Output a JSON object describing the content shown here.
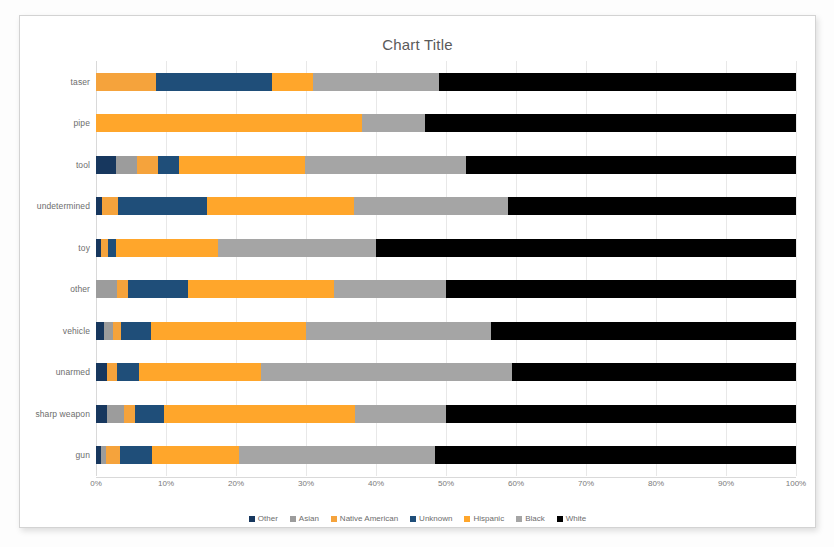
{
  "chart_data": {
    "type": "bar",
    "subtype": "stacked-horizontal-100percent",
    "title": "Chart Title",
    "xlabel": "",
    "ylabel": "",
    "xlim": [
      0,
      100
    ],
    "xticks": [
      "0%",
      "10%",
      "20%",
      "30%",
      "40%",
      "50%",
      "60%",
      "70%",
      "80%",
      "90%",
      "100%"
    ],
    "grid": true,
    "legend_position": "bottom",
    "categories": [
      "taser",
      "pipe",
      "tool",
      "undetermined",
      "toy",
      "other",
      "vehicle",
      "unarmed",
      "sharp weapon",
      "gun"
    ],
    "series": [
      {
        "name": "Other",
        "color": "#17375E",
        "values": [
          0.0,
          0.0,
          2.9,
          0.8,
          0.7,
          0.0,
          1.2,
          1.6,
          1.5,
          0.7
        ]
      },
      {
        "name": "Asian",
        "color": "#9C9C9C",
        "values": [
          0.0,
          0.0,
          3.0,
          0.0,
          0.0,
          3.0,
          1.2,
          0.0,
          2.5,
          0.8
        ]
      },
      {
        "name": "Native American",
        "color": "#F5A33C",
        "values": [
          8.6,
          0.0,
          3.0,
          2.3,
          1.0,
          1.6,
          1.2,
          1.4,
          1.5,
          2.0
        ]
      },
      {
        "name": "Unknown",
        "color": "#1F4E79",
        "values": [
          16.5,
          0.0,
          3.0,
          12.8,
          1.2,
          8.5,
          4.2,
          3.2,
          4.2,
          4.5
        ]
      },
      {
        "name": "Hispanic",
        "color": "#FFA62B",
        "values": [
          5.9,
          38.0,
          18.0,
          21.0,
          14.6,
          20.9,
          22.2,
          17.4,
          27.3,
          12.5
        ]
      },
      {
        "name": "Black",
        "color": "#A5A5A5",
        "values": [
          18.0,
          9.0,
          23.0,
          22.0,
          22.5,
          16.0,
          26.5,
          35.9,
          13.0,
          28.0
        ]
      },
      {
        "name": "White",
        "color": "#000000",
        "values": [
          51.0,
          53.0,
          47.1,
          41.1,
          60.0,
          50.0,
          43.5,
          40.5,
          50.0,
          51.5
        ]
      }
    ]
  }
}
